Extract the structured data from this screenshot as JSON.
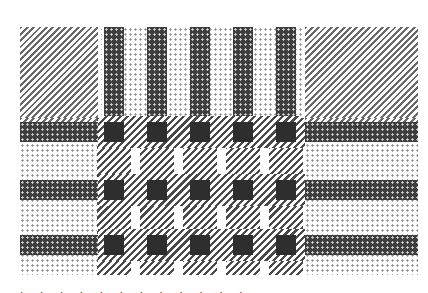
{
  "image": {
    "description": "Halftone grayscale plaid / tartan fabric pattern",
    "colors": {
      "background": "#ffffff",
      "dark": "#2e2e2e",
      "mid": "#4a4a4a",
      "light": "#8a8a8a"
    },
    "vertical_stripes_x": [
      84,
      127,
      170,
      213,
      256
    ],
    "stripe_width": 20,
    "horizontal_bands_y": [
      95,
      153,
      208
    ],
    "band_height": 20,
    "corner_block_left": {
      "x": 0,
      "w": 78
    },
    "corner_block_right": {
      "x": 285,
      "w": 113
    },
    "top_zone_height": 91
  },
  "caption": {
    "text": "˙ ˙ ˙ ˙ ˙ ˙ ˙ ˙ ˙ ˙ ˙ ˙"
  }
}
